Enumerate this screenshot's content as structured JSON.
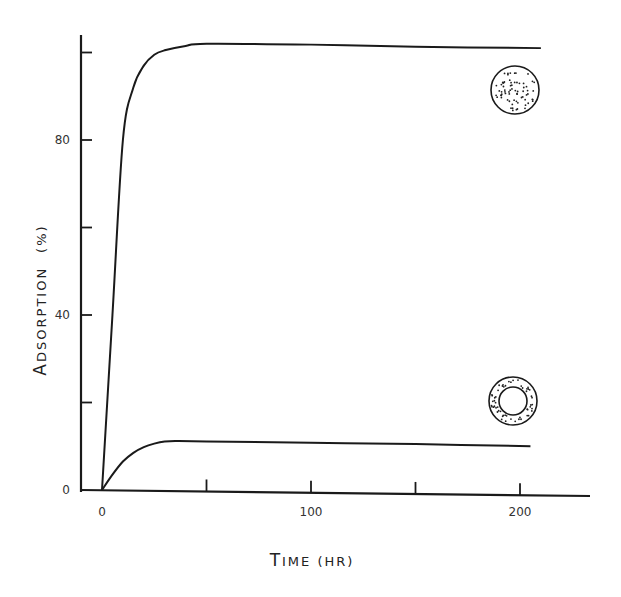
{
  "chart_data": {
    "type": "line",
    "title": "",
    "xlabel": "Time (hr)",
    "ylabel": "Adsorption (%)",
    "xlabel_display": {
      "first": "T",
      "rest": "IME (HR)"
    },
    "ylabel_display": {
      "first": "A",
      "rest": "DSORPTION",
      "unit": "(%)"
    },
    "xlim": [
      -12,
      235
    ],
    "ylim": [
      0,
      104
    ],
    "x_ticks": [
      0,
      50,
      100,
      150,
      200
    ],
    "x_tick_labels": [
      "0",
      "",
      "100",
      "",
      "200"
    ],
    "y_ticks": [
      0,
      20,
      40,
      60,
      80,
      100
    ],
    "y_tick_labels": [
      "0",
      "",
      "40",
      "",
      "80",
      ""
    ],
    "grid": false,
    "legend": "none (series identified by inline particle icons)",
    "series": [
      {
        "name": "Solid particle (uniformly dotted circle)",
        "icon": "solid-dotted-circle",
        "x": [
          0,
          5,
          10,
          15,
          20,
          25,
          30,
          40,
          50,
          100,
          150,
          210
        ],
        "y": [
          0,
          40,
          80,
          92,
          97,
          99.5,
          100.5,
          101.5,
          102,
          101.8,
          101.3,
          101
        ]
      },
      {
        "name": "Hollow particle (dotted ring)",
        "icon": "dotted-ring",
        "x": [
          0,
          5,
          10,
          15,
          20,
          25,
          30,
          35,
          50,
          100,
          150,
          205
        ],
        "y": [
          0,
          3.5,
          6.5,
          8.5,
          9.8,
          10.6,
          11.1,
          11.2,
          11.1,
          10.8,
          10.5,
          10
        ]
      }
    ]
  }
}
